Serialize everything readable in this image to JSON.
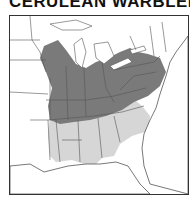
{
  "title": "CERULEAN WARBLER",
  "map": {
    "region": "Eastern United States",
    "legend": [
      {
        "label": "Breeding range",
        "color": "#7a7a7a"
      },
      {
        "label": "Migration range",
        "color": "#d6d6d6"
      }
    ],
    "colors": {
      "breeding": "#7a7a7a",
      "migration": "#d6d6d6",
      "water": "#ffffff",
      "border": "#555555"
    }
  }
}
